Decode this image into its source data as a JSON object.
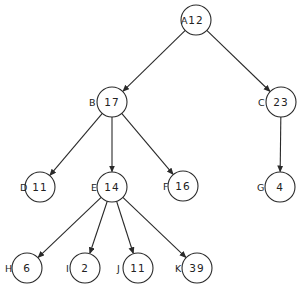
{
  "diagram": {
    "type": "tree",
    "stroke_color": "#2a2a2a",
    "node_radius": 15,
    "nodes": [
      {
        "id": "A",
        "label": "A",
        "value": "12",
        "x": 196,
        "y": 20,
        "lx": 181
      },
      {
        "id": "B",
        "label": "B",
        "value": "17",
        "x": 112,
        "y": 102,
        "lx": 89
      },
      {
        "id": "C",
        "label": "C",
        "value": "23",
        "x": 281,
        "y": 102,
        "lx": 258
      },
      {
        "id": "D",
        "label": "D",
        "value": "11",
        "x": 40,
        "y": 187,
        "lx": 20
      },
      {
        "id": "E",
        "label": "E",
        "value": "14",
        "x": 112,
        "y": 187,
        "lx": 91
      },
      {
        "id": "F",
        "label": "F",
        "value": "16",
        "x": 183,
        "y": 186,
        "lx": 163
      },
      {
        "id": "G",
        "label": "G",
        "value": "4",
        "x": 280,
        "y": 187,
        "lx": 257
      },
      {
        "id": "H",
        "label": "H",
        "value": "6",
        "x": 27,
        "y": 268,
        "lx": 5
      },
      {
        "id": "I",
        "label": "I",
        "value": "2",
        "x": 85,
        "y": 268,
        "lx": 66
      },
      {
        "id": "J",
        "label": "J",
        "value": "11",
        "x": 138,
        "y": 268,
        "lx": 117
      },
      {
        "id": "K",
        "label": "K",
        "value": "39",
        "x": 197,
        "y": 268,
        "lx": 175
      }
    ],
    "edges": [
      {
        "from": "A",
        "to": "B"
      },
      {
        "from": "A",
        "to": "C"
      },
      {
        "from": "B",
        "to": "D"
      },
      {
        "from": "B",
        "to": "E"
      },
      {
        "from": "B",
        "to": "F"
      },
      {
        "from": "C",
        "to": "G"
      },
      {
        "from": "E",
        "to": "H"
      },
      {
        "from": "E",
        "to": "I"
      },
      {
        "from": "E",
        "to": "J"
      },
      {
        "from": "E",
        "to": "K"
      }
    ]
  }
}
